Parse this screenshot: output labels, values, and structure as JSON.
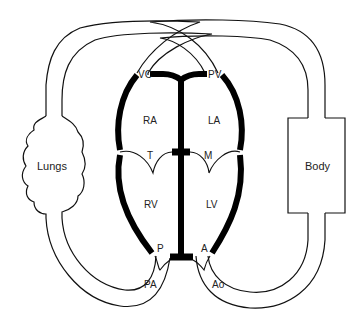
{
  "diagram": {
    "organs": {
      "lungs": "Lungs",
      "body": "Body"
    },
    "chambers": {
      "ra": "RA",
      "la": "LA",
      "rv": "RV",
      "lv": "LV"
    },
    "valves": {
      "vc": "VC",
      "pv": "PV",
      "t": "T",
      "m": "M",
      "p": "P",
      "a": "A"
    },
    "vessels": {
      "pa": "PA",
      "ao": "Ao"
    },
    "colors": {
      "line": "#111111",
      "wall": "#000000",
      "background": "#ffffff"
    }
  }
}
